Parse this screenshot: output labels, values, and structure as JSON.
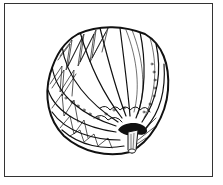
{
  "illustration": {
    "subject": "pumpkin line drawing",
    "style": "black ink line art",
    "colors": {
      "background": "#ffffff",
      "ink": "#111111",
      "frame": "#333333"
    },
    "frame": {
      "x": 4,
      "y": 3,
      "width": 209,
      "height": 174
    }
  }
}
